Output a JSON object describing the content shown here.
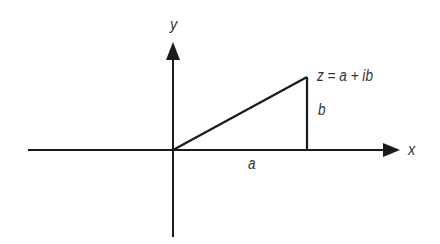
{
  "diagram": {
    "colors": {
      "stroke": "#1a1a1a",
      "text": "#333333",
      "background": "#ffffff"
    },
    "axes": {
      "x_label": "x",
      "y_label": "y"
    },
    "labels": {
      "point": "z = a + ib",
      "real_part": "a",
      "imaginary_part": "b"
    },
    "geometry": {
      "origin": [
        173,
        150
      ],
      "point": [
        307,
        77
      ],
      "x_axis": {
        "from": [
          28,
          150
        ],
        "to": [
          400,
          150
        ]
      },
      "y_axis": {
        "from": [
          173,
          237
        ],
        "to": [
          173,
          42
        ]
      }
    }
  }
}
